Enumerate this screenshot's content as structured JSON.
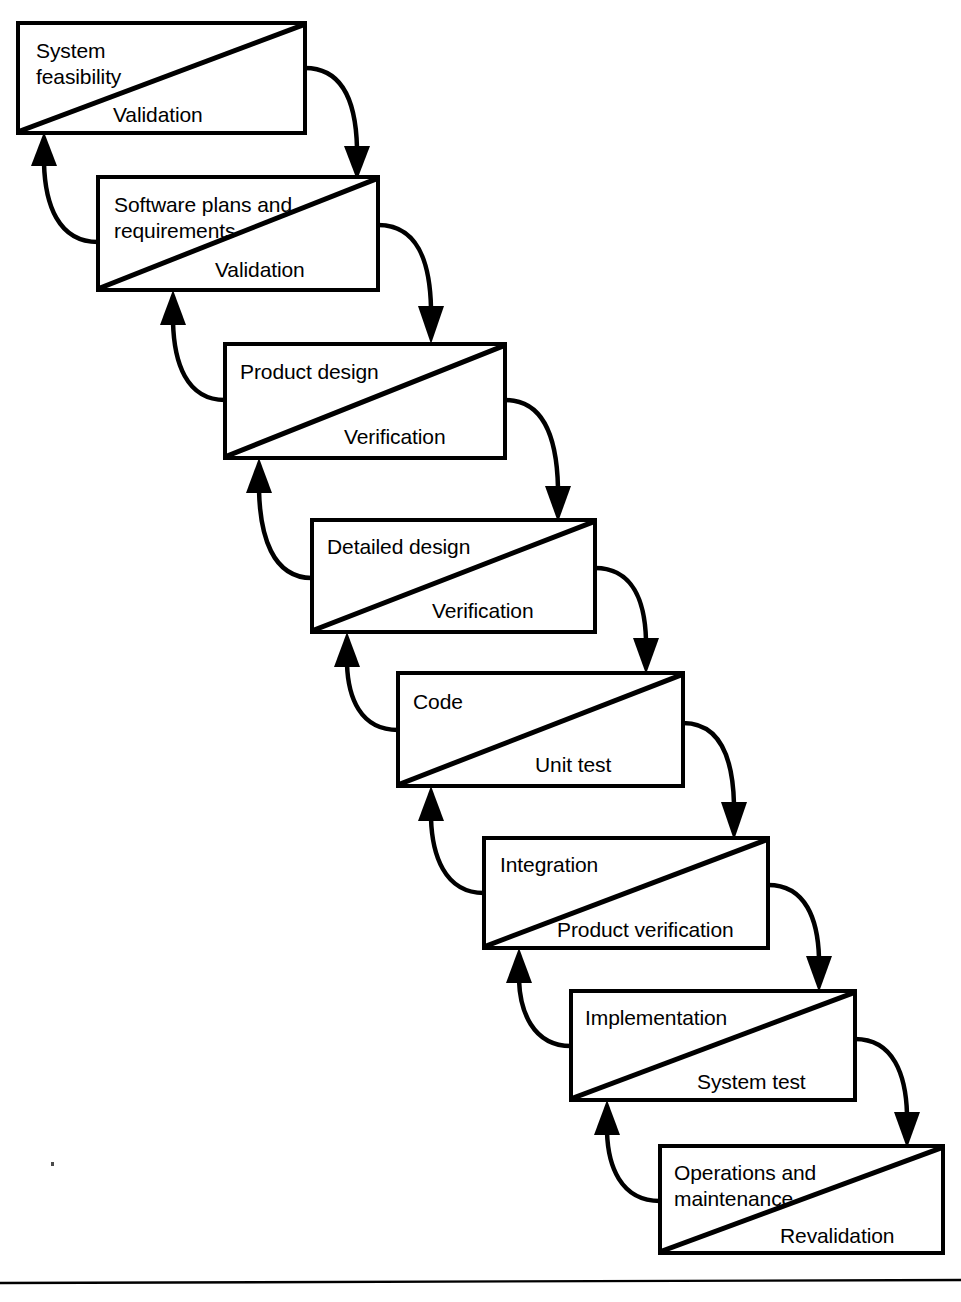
{
  "diagram": {
    "type": "waterfall-lifecycle",
    "colors": {
      "stroke": "#000000",
      "background": "#ffffff",
      "text": "#000000"
    },
    "stages": [
      {
        "id": "system-feasibility",
        "primary_label": "System",
        "primary_label_line2": "feasibility",
        "secondary_label": "Validation",
        "box": {
          "x": 18,
          "y": 23,
          "width": 287,
          "height": 110
        }
      },
      {
        "id": "software-plans-and-requirements",
        "primary_label": "Software plans and",
        "primary_label_line2": "requirements",
        "secondary_label": "Validation",
        "box": {
          "x": 98,
          "y": 177,
          "width": 280,
          "height": 113
        }
      },
      {
        "id": "product-design",
        "primary_label": "Product design",
        "primary_label_line2": "",
        "secondary_label": "Verification",
        "box": {
          "x": 225,
          "y": 344,
          "width": 280,
          "height": 114
        }
      },
      {
        "id": "detailed-design",
        "primary_label": "Detailed design",
        "primary_label_line2": "",
        "secondary_label": "Verification",
        "box": {
          "x": 312,
          "y": 520,
          "width": 283,
          "height": 112
        }
      },
      {
        "id": "code",
        "primary_label": "Code",
        "primary_label_line2": "",
        "secondary_label": "Unit test",
        "box": {
          "x": 398,
          "y": 673,
          "width": 285,
          "height": 113
        }
      },
      {
        "id": "integration",
        "primary_label": "Integration",
        "primary_label_line2": "",
        "secondary_label": "Product verification",
        "box": {
          "x": 484,
          "y": 838,
          "width": 284,
          "height": 110
        }
      },
      {
        "id": "implementation",
        "primary_label": "Implementation",
        "primary_label_line2": "",
        "secondary_label": "System test",
        "box": {
          "x": 571,
          "y": 991,
          "width": 284,
          "height": 109
        }
      },
      {
        "id": "operations-and-maintenance",
        "primary_label": "Operations and",
        "primary_label_line2": "maintenance",
        "secondary_label": "Revalidation",
        "box": {
          "x": 660,
          "y": 1146,
          "width": 283,
          "height": 107
        }
      }
    ],
    "forward_flow_count": 7,
    "feedback_flow_count": 7,
    "baseline_rule": {
      "y": 1282,
      "x1": 0,
      "x2": 961
    }
  }
}
